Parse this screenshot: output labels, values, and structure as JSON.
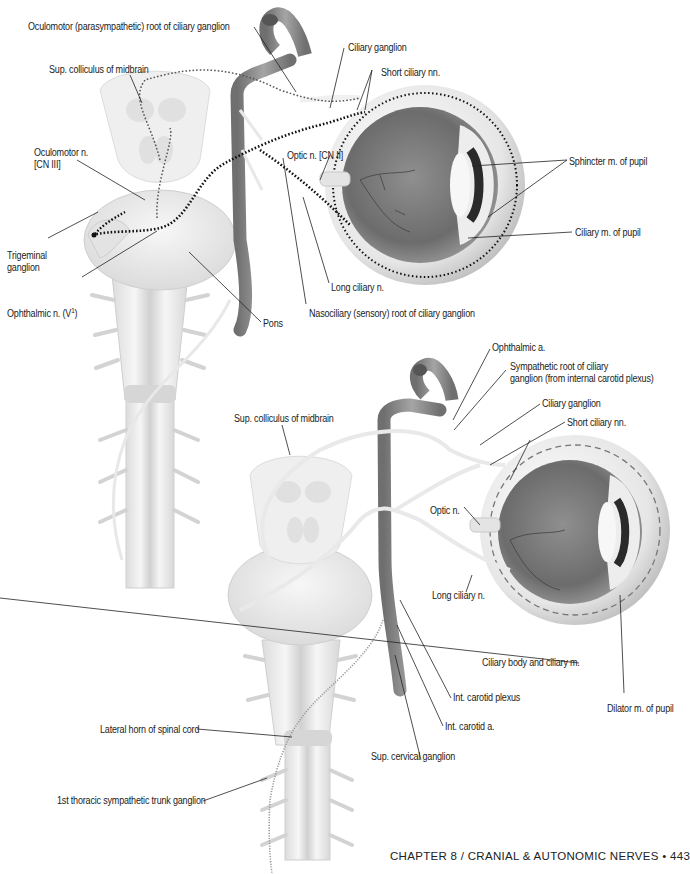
{
  "page": {
    "footer": "CHAPTER 8 / CRANIAL & AUTONOMIC NERVES • 443",
    "chapter": "CHAPTER 8",
    "section": "CRANIAL & AUTONOMIC NERVES",
    "page_number": "443"
  },
  "colors": {
    "vessel": "#8a8a8a",
    "vessel_highlight": "#e9e9e9",
    "brainstem": "#ececec",
    "eye_interior": "#7a7a7a",
    "eye_sclera": "#e4e4e4",
    "nerve": "#f2f2f2",
    "dotted_path": "#111111",
    "leader_line": "#222222"
  },
  "figure_top": {
    "title": "Parasympathetic innervation of the eye (ciliary ganglion)",
    "labels": {
      "oculomotor_root": "Oculomotor (parasympathetic) root of ciliary ganglion",
      "sup_colliculus": "Sup. colliculus of midbrain",
      "ciliary_ganglion": "Ciliary ganglion",
      "short_ciliary": "Short ciliary nn.",
      "oculomotor_n_line1": "Oculomotor n.",
      "oculomotor_n_line2": "[CN III]",
      "optic_n": "Optic n. [CN II]",
      "sphincter": "Sphincter m. of pupil",
      "ciliary_m": "Ciliary m. of pupil",
      "trigeminal_line1": "Trigeminal",
      "trigeminal_line2": "ganglion",
      "ophthalmic_n": "Ophthalmic n. (V",
      "ophthalmic_n_sup": "1",
      "ophthalmic_n_end": ")",
      "long_ciliary": "Long ciliary n.",
      "nasociliary_root": "Nasociliary (sensory) root of ciliary ganglion",
      "pons": "Pons"
    }
  },
  "figure_bottom": {
    "title": "Sympathetic innervation of the eye",
    "labels": {
      "ophthalmic_a": "Ophthalmic a.",
      "sympathetic_root_line1": "Sympathetic root of ciliary",
      "sympathetic_root_line2": "ganglion (from internal carotid plexus)",
      "ciliary_ganglion": "Ciliary ganglion",
      "short_ciliary": "Short ciliary nn.",
      "sup_colliculus": "Sup. colliculus of midbrain",
      "optic_n": "Optic n.",
      "long_ciliary": "Long ciliary n.",
      "ciliary_body": "Ciliary body and ciliary m.",
      "dilator": "Dilator m. of pupil",
      "int_carotid_plexus": "Int. carotid plexus",
      "int_carotid_a": "Int. carotid a.",
      "lateral_horn": "Lateral horn of spinal cord",
      "sup_cervical": "Sup. cervical ganglion",
      "first_thoracic": "1st thoracic sympathetic trunk ganglion"
    }
  }
}
